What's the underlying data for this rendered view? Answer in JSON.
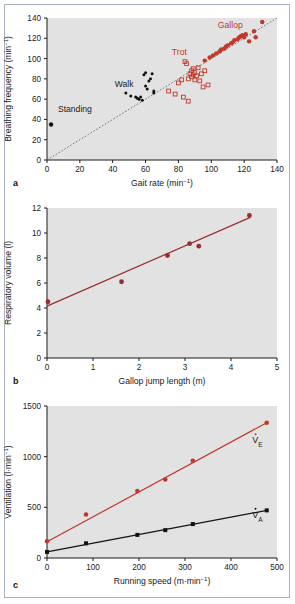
{
  "figure": {
    "panel_labels": [
      "a",
      "b",
      "c"
    ],
    "background_color": "#e2e2e2",
    "frame_color": "#aab3c4",
    "red_color": "#c0392b",
    "dark_red_color": "#9b2d2d",
    "black_color": "#111111"
  },
  "panel_a": {
    "letter": "a",
    "xlabel": "Gait rate (min",
    "xlabel_sup": "−1",
    "xlabel_tail": ")",
    "ylabel": "Breathing frequency (min",
    "ylabel_sup": "−1",
    "ylabel_tail": ")",
    "xticks": [
      "0",
      "20",
      "40",
      "60",
      "80",
      "100",
      "120",
      "140"
    ],
    "yticks": [
      "0",
      "20",
      "40",
      "60",
      "80",
      "100",
      "120",
      "140"
    ],
    "annotations": [
      {
        "text": "Standing",
        "color": "#111111"
      },
      {
        "text": "Walk",
        "color": "#111111"
      },
      {
        "text": "Trot",
        "color": "#c0392b"
      },
      {
        "text": "Gallop",
        "color": "#c0392b"
      }
    ]
  },
  "panel_b": {
    "letter": "b",
    "xlabel": "Gallop jump length (m)",
    "ylabel": "Respiratory volume (l)",
    "xticks": [
      "0",
      "1",
      "2",
      "3",
      "4",
      "5"
    ],
    "yticks": [
      "0",
      "2",
      "4",
      "6",
      "8",
      "10",
      "12"
    ]
  },
  "panel_c": {
    "letter": "c",
    "xlabel": "Running speed (m·min",
    "xlabel_sup": "−1",
    "xlabel_tail": ")",
    "ylabel": "Ventilation (l·min",
    "ylabel_sup": "−1",
    "ylabel_tail": ")",
    "xticks": [
      "0",
      "100",
      "200",
      "300",
      "400",
      "500"
    ],
    "yticks": [
      "0",
      "500",
      "1000",
      "1500"
    ],
    "curve_labels": [
      {
        "base": "V",
        "sub": "E",
        "color": "#c0392b"
      },
      {
        "base": "V",
        "sub": "A",
        "color": "#111111"
      }
    ]
  },
  "chart_data": [
    {
      "type": "scatter",
      "panel": "a",
      "title": "",
      "xlabel": "Gait rate (min⁻¹)",
      "ylabel": "Breathing frequency (min⁻¹)",
      "xlim": [
        0,
        140
      ],
      "ylim": [
        0,
        140
      ],
      "grid": false,
      "identity_line": {
        "from": [
          0,
          0
        ],
        "to": [
          140,
          140
        ],
        "style": "dotted",
        "color": "#555555"
      },
      "legend_position": "inline-annotations",
      "series": [
        {
          "name": "Standing",
          "marker": "filled-circle",
          "color": "#111111",
          "points": [
            [
              2.5,
              35
            ]
          ]
        },
        {
          "name": "Walk",
          "marker": "filled-circle-small",
          "color": "#111111",
          "points": [
            [
              48,
              66
            ],
            [
              51,
              63
            ],
            [
              54,
              62
            ],
            [
              55,
              61
            ],
            [
              56,
              60
            ],
            [
              57,
              62
            ],
            [
              59,
              84
            ],
            [
              60,
              86
            ],
            [
              60,
              73
            ],
            [
              61,
              70
            ],
            [
              62,
              78
            ],
            [
              63,
              80
            ],
            [
              64,
              85
            ],
            [
              65,
              68
            ],
            [
              65,
              66
            ],
            [
              58,
              59
            ]
          ]
        },
        {
          "name": "Trot",
          "marker": "open-square",
          "color": "#c0392b",
          "points": [
            [
              74,
              68
            ],
            [
              78,
              65
            ],
            [
              80,
              76
            ],
            [
              82,
              79
            ],
            [
              83,
              62
            ],
            [
              84,
              97
            ],
            [
              85,
              95
            ],
            [
              86,
              80
            ],
            [
              87,
              85
            ],
            [
              88,
              88
            ],
            [
              88,
              82
            ],
            [
              89,
              90
            ],
            [
              89,
              84
            ],
            [
              90,
              86
            ],
            [
              90,
              79
            ],
            [
              91,
              83
            ],
            [
              92,
              91
            ],
            [
              93,
              78
            ],
            [
              94,
              85
            ],
            [
              95,
              72
            ],
            [
              96,
              88
            ],
            [
              98,
              74
            ],
            [
              86,
              58
            ]
          ]
        },
        {
          "name": "Gallop",
          "marker": "filled-circle",
          "color": "#c0392b",
          "points": [
            [
              96,
              98
            ],
            [
              99,
              101
            ],
            [
              101,
              103
            ],
            [
              103,
              105
            ],
            [
              105,
              107
            ],
            [
              106,
              109
            ],
            [
              108,
              110
            ],
            [
              109,
              112
            ],
            [
              110,
              113
            ],
            [
              112,
              115
            ],
            [
              113,
              116
            ],
            [
              114,
              118
            ],
            [
              116,
              119
            ],
            [
              117,
              121
            ],
            [
              118,
              122
            ],
            [
              119,
              123
            ],
            [
              120,
              121
            ],
            [
              121,
              124
            ],
            [
              123,
              117
            ],
            [
              126,
              127
            ],
            [
              127,
              121
            ],
            [
              131,
              136
            ]
          ]
        }
      ]
    },
    {
      "type": "scatter",
      "panel": "b",
      "title": "",
      "xlabel": "Gallop jump length (m)",
      "ylabel": "Respiratory volume (l)",
      "xlim": [
        0,
        5
      ],
      "ylim": [
        0,
        12
      ],
      "grid": false,
      "legend_position": "none",
      "series": [
        {
          "name": "Respiratory volume",
          "marker": "filled-circle",
          "color": "#9b2d2d",
          "points": [
            [
              0.02,
              4.5
            ],
            [
              1.62,
              6.1
            ],
            [
              2.62,
              8.2
            ],
            [
              3.1,
              9.15
            ],
            [
              3.3,
              8.95
            ],
            [
              4.4,
              11.4
            ]
          ],
          "fit_line": {
            "from": [
              0,
              4.15
            ],
            "to": [
              4.42,
              11.25
            ],
            "color": "#9b2d2d"
          }
        }
      ]
    },
    {
      "type": "scatter",
      "panel": "c",
      "title": "",
      "xlabel": "Running speed (m·min⁻¹)",
      "ylabel": "Ventilation (l·min⁻¹)",
      "xlim": [
        0,
        560
      ],
      "ylim": [
        0,
        1500
      ],
      "grid": false,
      "legend_position": "inline-labels",
      "series": [
        {
          "name": "V̇E",
          "marker": "filled-circle",
          "color": "#c0392b",
          "points": [
            [
              0,
              165
            ],
            [
              95,
              430
            ],
            [
              220,
              660
            ],
            [
              288,
              775
            ],
            [
              355,
              960
            ],
            [
              535,
              1335
            ]
          ],
          "fit_line": {
            "from": [
              0,
              160
            ],
            "to": [
              535,
              1335
            ],
            "color": "#c0392b"
          }
        },
        {
          "name": "V̇A",
          "marker": "filled-square",
          "color": "#111111",
          "points": [
            [
              0,
              60
            ],
            [
              95,
              145
            ],
            [
              220,
              228
            ],
            [
              288,
              275
            ],
            [
              355,
              335
            ],
            [
              535,
              470
            ]
          ],
          "fit_line": {
            "from": [
              0,
              60
            ],
            "to": [
              535,
              470
            ],
            "color": "#111111"
          }
        }
      ]
    }
  ]
}
